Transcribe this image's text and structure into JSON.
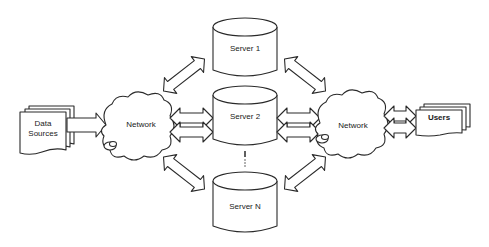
{
  "diagram": {
    "type": "network architecture",
    "nodes": {
      "data_sources": {
        "label_line1": "Data",
        "label_line2": "Sources",
        "shape": "document-stack"
      },
      "network_left": {
        "label": "Network",
        "shape": "cloud"
      },
      "server_1": {
        "label": "Server 1",
        "shape": "cylinder"
      },
      "server_2": {
        "label": "Server 2",
        "shape": "cylinder"
      },
      "server_ellipsis": {
        "label": "⋮",
        "shape": "dotted-line"
      },
      "server_n": {
        "label": "Server N",
        "shape": "cylinder"
      },
      "network_right": {
        "label": "Network",
        "shape": "cloud"
      },
      "users": {
        "label": "Users",
        "shape": "document-stack"
      }
    },
    "edges": [
      {
        "from": "data_sources",
        "to": "network_left",
        "direction": "one-way"
      },
      {
        "from": "network_left",
        "to": "server_1",
        "direction": "two-way"
      },
      {
        "from": "network_left",
        "to": "server_2",
        "direction": "two-way"
      },
      {
        "from": "network_left",
        "to": "server_n",
        "direction": "two-way"
      },
      {
        "from": "server_1",
        "to": "network_right",
        "direction": "two-way"
      },
      {
        "from": "server_2",
        "to": "network_right",
        "direction": "two-way"
      },
      {
        "from": "server_n",
        "to": "network_right",
        "direction": "two-way"
      },
      {
        "from": "network_right",
        "to": "users",
        "direction": "two-way"
      }
    ],
    "colors": {
      "stroke": "#2a2a2a",
      "fill": "#ffffff",
      "text": "#1a1a1a"
    }
  }
}
